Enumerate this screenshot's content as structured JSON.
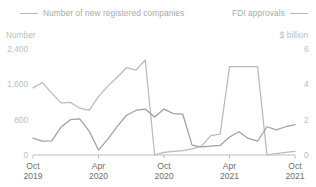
{
  "legend": {
    "left": {
      "label": "Number of new registered companies",
      "swatch": "line-swatch",
      "color": "#b9b9b9"
    },
    "right": {
      "label": "FDI approvals",
      "swatch": "line-swatch",
      "color": "#a0a0a0"
    }
  },
  "axes": {
    "left_unit": "Number",
    "right_unit": "$ billion"
  },
  "chart_data": {
    "type": "line",
    "title": "",
    "subtitle": "",
    "xlabel": "",
    "ylabel": "Number",
    "y2label": "$ billion",
    "grid": false,
    "legend_position": "top",
    "x": [
      "Oct 2019",
      "Nov 2019",
      "Dec 2019",
      "Jan 2020",
      "Feb 2020",
      "Mar 2020",
      "Apr 2020",
      "May 2020",
      "Jun 2020",
      "Jul 2020",
      "Aug 2020",
      "Sep 2020",
      "Oct 2020",
      "Nov 2020",
      "Dec 2020",
      "Jan 2021",
      "Feb 2021",
      "Mar 2021",
      "Apr 2021",
      "May 2021",
      "Jun 2021",
      "Jul 2021",
      "Aug 2021",
      "Sep 2021",
      "Oct 2021",
      "Nov 2021",
      "Dec 2021",
      "Jan 2022",
      "Feb 2022"
    ],
    "xtick_labels": [
      "Oct\n2019",
      "Apr\n2020",
      "Oct\n2020",
      "Apr\n2021",
      "Oct\n2021"
    ],
    "xticks": [
      {
        "line1": "Oct",
        "line2": "2019"
      },
      {
        "line1": "Apr",
        "line2": "2020"
      },
      {
        "line1": "Oct",
        "line2": "2020"
      },
      {
        "line1": "Apr",
        "line2": "2021"
      },
      {
        "line1": "Oct",
        "line2": "2021"
      }
    ],
    "yticks_left": [
      "2,400",
      "1,600",
      "800",
      "0"
    ],
    "yticks_right": [
      "6",
      "4",
      "2",
      "0"
    ],
    "ylim": [
      0,
      2400
    ],
    "y2lim": [
      0,
      6
    ],
    "series": [
      {
        "name": "Number of new registered companies",
        "axis": "left",
        "color": "#b9b9b9",
        "values": [
          1520,
          1640,
          1400,
          1180,
          1190,
          1060,
          1010,
          1320,
          1560,
          1760,
          1980,
          1920,
          2150,
          0,
          60,
          80,
          100,
          140,
          200,
          440,
          470,
          2000,
          2000,
          2000,
          2000,
          0,
          30,
          60,
          80
        ]
      },
      {
        "name": "FDI approvals",
        "axis": "right",
        "color": "#a0a0a0",
        "values": [
          0.95,
          0.78,
          0.8,
          1.58,
          2.0,
          2.04,
          1.35,
          0.28,
          0.9,
          1.62,
          2.25,
          2.52,
          2.6,
          2.15,
          2.6,
          2.34,
          2.32,
          0.56,
          0.46,
          0.5,
          0.54,
          1.02,
          1.32,
          0.94,
          0.78,
          1.6,
          1.42,
          1.6,
          1.72
        ]
      }
    ]
  }
}
